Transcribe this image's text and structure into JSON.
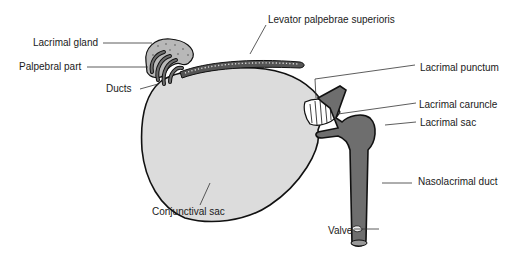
{
  "diagram": {
    "type": "anatomical-illustration",
    "colors": {
      "background": "#ffffff",
      "conjunctival_sac_fill": "#dcdcdc",
      "duct_fill": "#6e6e6e",
      "gland_fill": "#b8b8b8",
      "outline": "#111111",
      "leader_line": "#333333"
    },
    "labels": {
      "lacrimal_gland": "Lacrimal gland",
      "palpebral_part": "Palpebral part",
      "ducts": "Ducts",
      "levator": "Levator palpebrae superioris",
      "lacrimal_punctum": "Lacrimal punctum",
      "lacrimal_caruncle": "Lacrimal caruncle",
      "lacrimal_sac": "Lacrimal sac",
      "nasolacrimal_duct": "Nasolacrimal duct",
      "conjunctival_sac": "Conjunctival sac",
      "valve": "Valve"
    }
  }
}
